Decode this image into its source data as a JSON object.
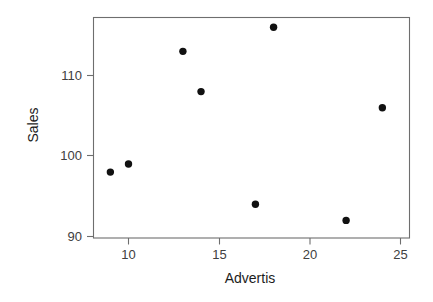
{
  "chart_data": {
    "type": "scatter",
    "title": "",
    "xlabel": "Advertis",
    "ylabel": "Sales",
    "xlim": [
      8.0,
      25.5
    ],
    "ylim": [
      89.3,
      117.3
    ],
    "xticks": [
      10,
      15,
      20,
      25
    ],
    "xtick_labels": [
      "10",
      "15",
      "20",
      "25"
    ],
    "yticks": [
      90,
      100,
      110
    ],
    "ytick_labels": [
      "90",
      "100",
      "110"
    ],
    "grid": false,
    "legend": "none",
    "marker": "filled-circle",
    "marker_color": "#111111",
    "axis_color": "#6e6e6e",
    "tick_label_color": "#404040",
    "axis_title_color": "#1c1c1c",
    "x": [
      9,
      10,
      13,
      14,
      17,
      18,
      22,
      24
    ],
    "y": [
      98,
      99,
      113,
      108,
      94,
      116,
      92,
      106
    ],
    "points": [
      {
        "x": 9,
        "y": 98
      },
      {
        "x": 10,
        "y": 99
      },
      {
        "x": 13,
        "y": 113
      },
      {
        "x": 14,
        "y": 108
      },
      {
        "x": 17,
        "y": 94
      },
      {
        "x": 18,
        "y": 116
      },
      {
        "x": 22,
        "y": 92
      },
      {
        "x": 24,
        "y": 106
      }
    ]
  },
  "axes": {
    "x_title": "Advertis",
    "y_title": "Sales",
    "x_tick_0": "10",
    "x_tick_1": "15",
    "x_tick_2": "20",
    "x_tick_3": "25",
    "y_tick_0": "90",
    "y_tick_1": "100",
    "y_tick_2": "110"
  }
}
